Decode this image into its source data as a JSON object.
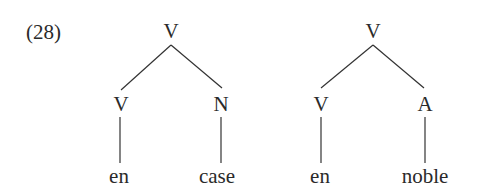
{
  "example_number": "(28)",
  "trees": [
    {
      "root": "V",
      "children": [
        {
          "label": "V",
          "leaf": "en"
        },
        {
          "label": "N",
          "leaf": "case"
        }
      ]
    },
    {
      "root": "V",
      "children": [
        {
          "label": "V",
          "leaf": "en"
        },
        {
          "label": "A",
          "leaf": "noble"
        }
      ]
    }
  ]
}
